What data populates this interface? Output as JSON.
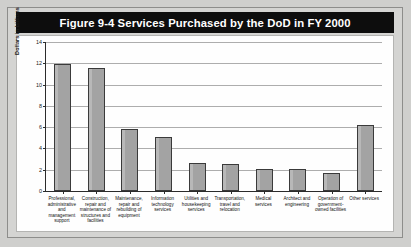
{
  "figure": {
    "title": "Figure 9-4  Services Purchased by the DoD in FY 2000",
    "title_bar_color": "#0d0d0d",
    "title_text_color": "#ffffff",
    "page_background": "#cfcfcd",
    "plot_background": "#fefefe",
    "bar_fill_color": "#a3a3a3",
    "bar_border_color": "#3a3a3a",
    "gridline_color": "#adadad",
    "axis_color": "#2b2b2b"
  },
  "chart_data": {
    "type": "bar",
    "title": "Figure 9-4  Services Purchased by the DoD in FY 2000",
    "xlabel": "",
    "ylabel": "Dollars in billions",
    "ylim": [
      0,
      14
    ],
    "yticks": [
      0,
      2,
      4,
      6,
      8,
      10,
      12,
      14
    ],
    "ytick_labels": [
      "0",
      "2",
      "4",
      "6",
      "8",
      "10",
      "12",
      "14"
    ],
    "grid": "horizontal",
    "legend": "none",
    "categories": [
      "Professional, administrative and management support",
      "Construction, repair and maintenance of structures and facilities",
      "Maintenance, repair and rebuilding of equipment",
      "Information technology services",
      "Utilities and housekeeping services",
      "Transportation, travel and relocation",
      "Medical services",
      "Architect and engineering",
      "Operation of government-owned facilities",
      "Other services"
    ],
    "category_lines": [
      [
        "Professional,",
        "administrative",
        "and",
        "management",
        "support"
      ],
      [
        "Construction,",
        "repair and",
        "maintenance of",
        "structures and",
        "facilities"
      ],
      [
        "Maintenance,",
        "repair and",
        "rebuilding of",
        "equipment"
      ],
      [
        "Information",
        "technology",
        "services"
      ],
      [
        "Utilities and",
        "housekeeping",
        "services"
      ],
      [
        "Transportation,",
        "travel and",
        "relocation"
      ],
      [
        "Medical",
        "services"
      ],
      [
        "Architect and",
        "engineering"
      ],
      [
        "Operation of",
        "government-",
        "owned facilities"
      ],
      [
        "Other services"
      ]
    ],
    "values": [
      11.9,
      11.6,
      5.8,
      5.1,
      2.6,
      2.5,
      2.1,
      2.1,
      1.7,
      6.2
    ]
  }
}
